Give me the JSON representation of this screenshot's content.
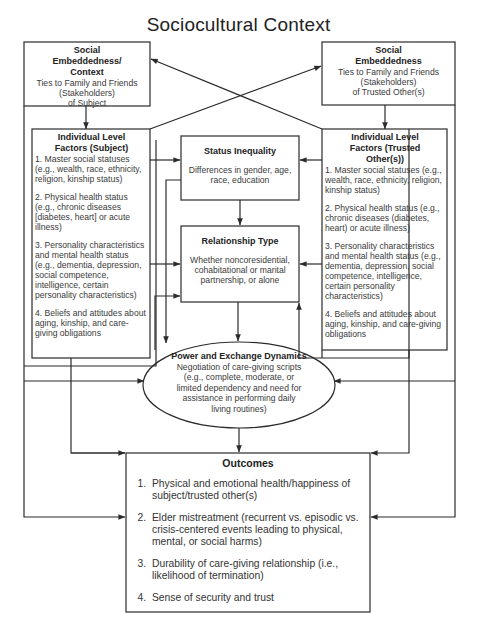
{
  "title": "Sociocultural Context",
  "social_embeddedness_subject": {
    "heading_lines": [
      "Social",
      "Embeddedness/",
      "Context"
    ],
    "body_lines": [
      "Ties to Family and Friends",
      "(Stakeholders)",
      "of Subject"
    ]
  },
  "social_embeddedness_trusted": {
    "heading_lines": [
      "Social",
      "Embeddedness"
    ],
    "body_lines": [
      "Ties to Family and Friends",
      "(Stakeholders)",
      "of Trusted Other(s)"
    ]
  },
  "individual_subject": {
    "heading_lines": [
      "Individual Level",
      "Factors (Subject)"
    ],
    "items": [
      "1.  Master social statuses (e.g., wealth, race, ethnicity, religion, kinship status)",
      "2.  Physical health status (e.g., chronic diseases [diabetes, heart] or acute illness)",
      "3.  Personality characteristics and mental health status (e.g., dementia, depression, social competence, intelligence, certain personality characteristics)",
      "4. Beliefs and attitudes about aging, kinship, and care-giving obligations"
    ]
  },
  "individual_trusted": {
    "heading_lines": [
      "Individual Level",
      "Factors (Trusted",
      "Other(s))"
    ],
    "items": [
      "1.  Master social statuses (e.g., wealth, race, ethnicity, religion, kinship status)",
      "2.  Physical health status (e.g., chronic diseases (diabetes, heart) or acute illness)",
      "3.  Personality characteristics and mental health status (e.g., dementia, depression, social competence, intelligence, certain personality characteristics)",
      "4. Beliefs and attitudes about aging, kinship, and care-giving obligations"
    ]
  },
  "status_inequality": {
    "heading": "Status Inequality",
    "body": "Differences in gender, age, race, education"
  },
  "relationship_type": {
    "heading": "Relationship Type",
    "body": "Whether noncoresidential, cohabitational or marital partnership, or alone"
  },
  "power_exchange": {
    "heading": "Power and Exchange Dynamics",
    "body_lines": [
      "Negotiation of care-giving scripts",
      "(e.g., complete, moderate, or",
      "limited dependency and need for",
      "assistance in performing daily",
      "living routines)"
    ]
  },
  "outcomes": {
    "heading": "Outcomes",
    "items": [
      {
        "num": "1.",
        "text": "Physical and emotional health/happiness of subject/trusted other(s)"
      },
      {
        "num": "2.",
        "text": "Elder mistreatment (recurrent vs. episodic vs. crisis-centered events leading to physical, mental, or social harms)"
      },
      {
        "num": "3.",
        "text": "Durability of care-giving relationship (i.e., likelihood of termination)"
      },
      {
        "num": "4.",
        "text": "Sense of security and trust"
      }
    ]
  },
  "colors": {
    "line": "#2b2b2b",
    "text": "#3a3a3a",
    "background": "#ffffff"
  }
}
